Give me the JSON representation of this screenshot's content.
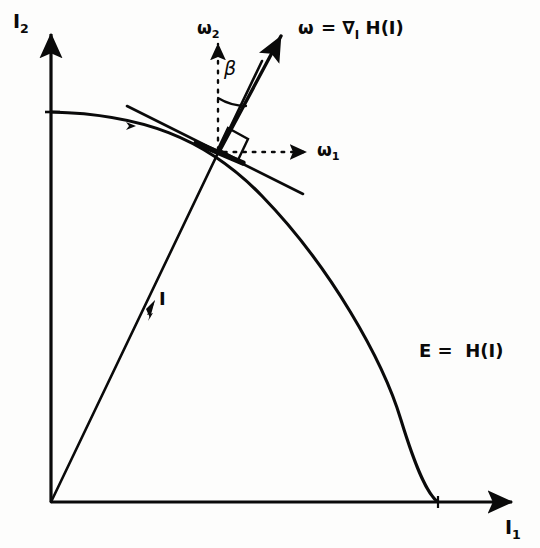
{
  "figure": {
    "kind": "phase-space-diagram",
    "background_color": "#fdfdfc",
    "ink_color": "#0a0a0a"
  },
  "axes": {
    "x_label": "I",
    "x_label_sub": "1",
    "y_label": "I",
    "y_label_sub": "2",
    "origin": [
      51,
      502
    ],
    "x_axis_end": [
      516,
      502
    ],
    "y_axis_end": [
      51,
      30
    ]
  },
  "curve": {
    "name": "energy-surface",
    "label_main": "E = H(I)",
    "label_lhs": "E",
    "label_eq": "=",
    "label_rhs": "H(I)",
    "y_intercept": [
      51,
      112
    ],
    "x_intercept": [
      438,
      502
    ],
    "shape": "superellipse-arc"
  },
  "tangent": {
    "name": "tangent-line",
    "start": [
      127,
      106
    ],
    "end": [
      303,
      194
    ]
  },
  "action_vector": {
    "name": "action-vector-I",
    "label": "I",
    "from": [
      51,
      502
    ],
    "through": [
      218,
      153
    ],
    "to": [
      262,
      61
    ],
    "arrow_at": [
      159,
      305
    ]
  },
  "frequency_vector": {
    "name": "frequency-vector-omega",
    "label_symbol": "ω",
    "label_eq": "=",
    "label_grad": "∇",
    "label_grad_sub": "I",
    "label_H": "H(I)",
    "label_full": "ω = ∇₁ H(I)",
    "from": [
      218,
      153
    ],
    "to": [
      284,
      31
    ]
  },
  "components": {
    "omega1": {
      "label": "ω",
      "label_sub": "1",
      "style": "dashed",
      "from": [
        222,
        152
      ],
      "to": [
        309,
        152
      ]
    },
    "omega2": {
      "label": "ω",
      "label_sub": "2",
      "style": "dashed",
      "from": [
        218,
        150
      ],
      "to": [
        218,
        38
      ]
    }
  },
  "angle": {
    "name": "beta-angle",
    "label": "β",
    "between": [
      "omega2-axis",
      "omega-vector"
    ],
    "vertex": [
      218,
      153
    ]
  },
  "right_angle": {
    "name": "right-angle-marker",
    "vertex": [
      218,
      153
    ],
    "size": 22
  }
}
